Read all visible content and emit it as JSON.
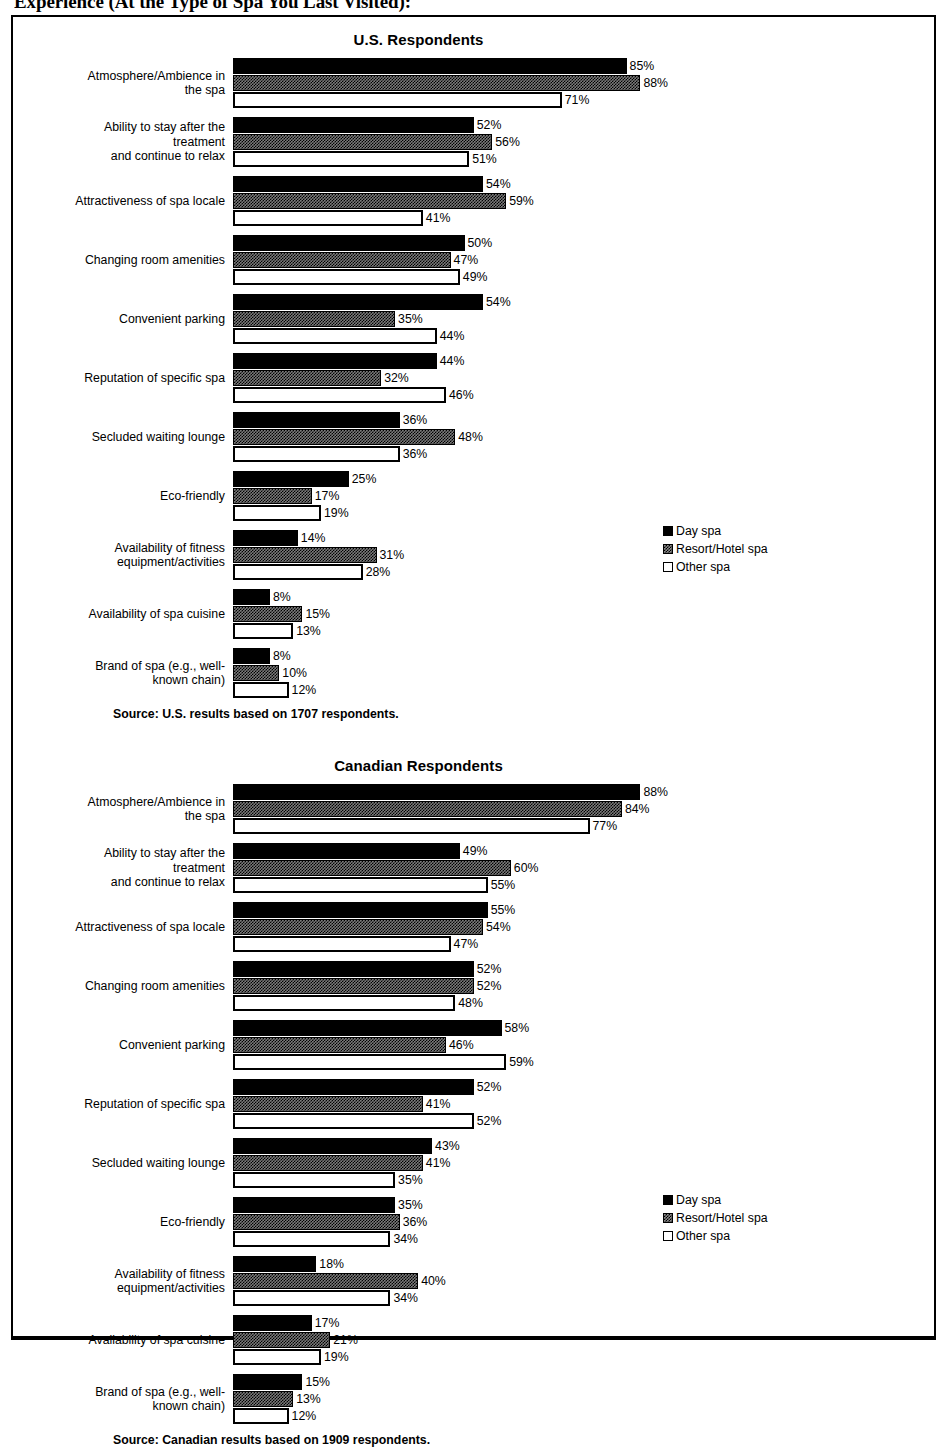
{
  "page_title": "Experience (At the Type of Spa You Last Visited):",
  "legend": {
    "items": [
      {
        "label": "Day spa",
        "swatch": "black-square-icon",
        "color": "#000000"
      },
      {
        "label": "Resort/Hotel spa",
        "swatch": "hatched-square-icon",
        "color": "#7a7a7a"
      },
      {
        "label": "Other spa",
        "swatch": "white-square-icon",
        "color": "#ffffff"
      }
    ]
  },
  "panels": [
    {
      "title": "U.S. Respondents",
      "source": "Source: U.S. results based on 1707 respondents."
    },
    {
      "title": "Canadian Respondents",
      "source": "Source: Canadian results based on 1909 respondents."
    }
  ],
  "chart_data": [
    {
      "type": "bar",
      "title": "U.S. Respondents",
      "orientation": "horizontal",
      "grouped": true,
      "xlabel": "",
      "ylabel": "",
      "xlim": [
        0,
        100
      ],
      "grid": false,
      "legend_position": "right",
      "value_suffix": "%",
      "categories": [
        "Atmosphere/Ambience in the spa",
        "Ability to stay after the treatment and continue to relax",
        "Attractiveness of spa locale",
        "Changing room amenities",
        "Convenient parking",
        "Reputation of specific spa",
        "Secluded waiting lounge",
        "Eco-friendly",
        "Availability of fitness equipment/activities",
        "Availability of spa cuisine",
        "Brand of spa (e.g., well-known chain)"
      ],
      "series": [
        {
          "name": "Day spa",
          "values": [
            85,
            52,
            54,
            50,
            54,
            44,
            36,
            25,
            14,
            8,
            8
          ]
        },
        {
          "name": "Resort/Hotel spa",
          "values": [
            88,
            56,
            59,
            47,
            35,
            32,
            48,
            17,
            31,
            15,
            10
          ]
        },
        {
          "name": "Other spa",
          "values": [
            71,
            51,
            41,
            49,
            44,
            46,
            36,
            19,
            28,
            13,
            12
          ]
        }
      ],
      "source": "Source: U.S. results based on 1707 respondents."
    },
    {
      "type": "bar",
      "title": "Canadian Respondents",
      "orientation": "horizontal",
      "grouped": true,
      "xlabel": "",
      "ylabel": "",
      "xlim": [
        0,
        100
      ],
      "grid": false,
      "legend_position": "right",
      "value_suffix": "%",
      "categories": [
        "Atmosphere/Ambience in the spa",
        "Ability to stay after the treatment and continue to relax",
        "Attractiveness of spa locale",
        "Changing room amenities",
        "Convenient parking",
        "Reputation of specific spa",
        "Secluded waiting lounge",
        "Eco-friendly",
        "Availability of fitness equipment/activities",
        "Availability of spa cuisine",
        "Brand of spa (e.g., well-known chain)"
      ],
      "series": [
        {
          "name": "Day spa",
          "values": [
            88,
            49,
            55,
            52,
            58,
            52,
            43,
            35,
            18,
            17,
            15
          ]
        },
        {
          "name": "Resort/Hotel spa",
          "values": [
            84,
            60,
            54,
            52,
            46,
            41,
            41,
            36,
            40,
            21,
            13
          ]
        },
        {
          "name": "Other spa",
          "values": [
            77,
            55,
            47,
            48,
            59,
            52,
            35,
            34,
            34,
            19,
            12
          ]
        }
      ],
      "source": "Source: Canadian results based on 1909 respondents."
    }
  ],
  "category_label_lines": [
    [
      "Atmosphere/Ambience in",
      "the spa"
    ],
    [
      "Ability to stay after the",
      "treatment",
      "and continue to relax"
    ],
    [
      "Attractiveness of spa locale"
    ],
    [
      "Changing room amenities"
    ],
    [
      "Convenient parking"
    ],
    [
      "Reputation of specific spa"
    ],
    [
      "Secluded waiting lounge"
    ],
    [
      "Eco-friendly"
    ],
    [
      "Availability of fitness",
      "equipment/activities"
    ],
    [
      "Availability of spa cuisine"
    ],
    [
      "Brand of spa (e.g., well-",
      "known chain)"
    ]
  ]
}
